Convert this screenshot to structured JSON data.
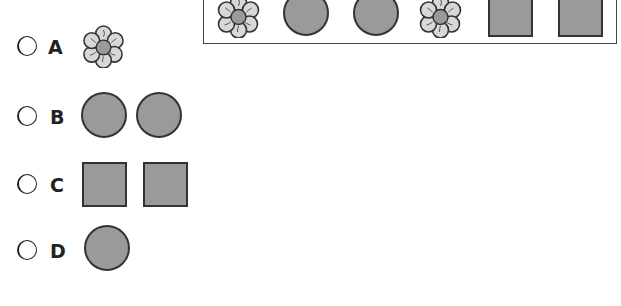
{
  "pattern": {
    "items": [
      "flower",
      "circle",
      "circle",
      "flower",
      "square",
      "square"
    ]
  },
  "options": [
    {
      "letter": "A",
      "shapes": [
        "flower"
      ]
    },
    {
      "letter": "B",
      "shapes": [
        "circle",
        "circle"
      ]
    },
    {
      "letter": "C",
      "shapes": [
        "square",
        "square"
      ]
    },
    {
      "letter": "D",
      "shapes": [
        "circle"
      ]
    }
  ],
  "colors": {
    "shape_fill": "#9a9a9a",
    "shape_border": "#333333",
    "petal_fill": "#d8d8d8"
  }
}
